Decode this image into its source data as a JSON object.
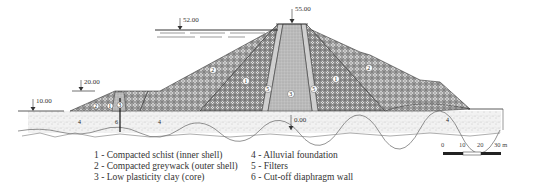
{
  "diagram": {
    "type": "dam-cross-section",
    "elevations": {
      "crest": "55.00",
      "reservoir": "52.00",
      "cofferdam_water": "20.00",
      "downstream_ground": "10.00",
      "foundation": "0.00"
    },
    "zone_labels": [
      "1",
      "2",
      "3",
      "4",
      "5",
      "6"
    ],
    "legend": [
      {
        "num": "1",
        "text": "1 - Compacted schist (inner shell)"
      },
      {
        "num": "2",
        "text": "2 - Compacted greywack (outer shell)"
      },
      {
        "num": "3",
        "text": "3 - Low plasticity clay (core)"
      },
      {
        "num": "4",
        "text": "4 - Alluvial foundation"
      },
      {
        "num": "5",
        "text": "5 - Filters"
      },
      {
        "num": "6",
        "text": "6 - Cut-off diaphragm wall"
      }
    ],
    "scale_bar": {
      "ticks": [
        "0",
        "10",
        "20",
        "30 m"
      ]
    },
    "colors": {
      "outline": "#333333",
      "shell_fill": "#9a9a9a",
      "core_fill": "#bdbdbd",
      "foundation_fill": "#eeeeee"
    }
  }
}
